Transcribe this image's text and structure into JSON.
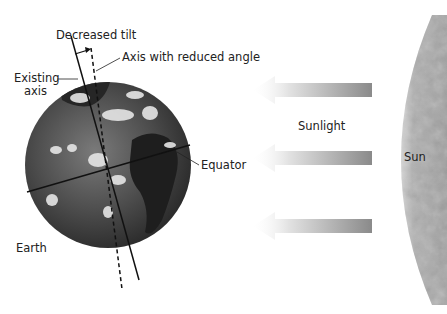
{
  "labels": {
    "decreased_tilt": "Decreased tilt",
    "axis_reduced": "Axis with reduced angle",
    "existing_axis_1": "Existing",
    "existing_axis_2": "axis",
    "equator": "Equator",
    "earth": "Earth",
    "sunlight": "Sunlight",
    "sun": "Sun"
  },
  "colors": {
    "ocean": "#4a4a4a",
    "land": "#1e1e1e",
    "cloud": "#e8e8e8",
    "sun": "#a8a8a8",
    "arrow": "#8c8c8c"
  },
  "arrows": [
    {
      "name": "sunlight-arrow-top"
    },
    {
      "name": "sunlight-arrow-middle"
    },
    {
      "name": "sunlight-arrow-bottom"
    }
  ]
}
